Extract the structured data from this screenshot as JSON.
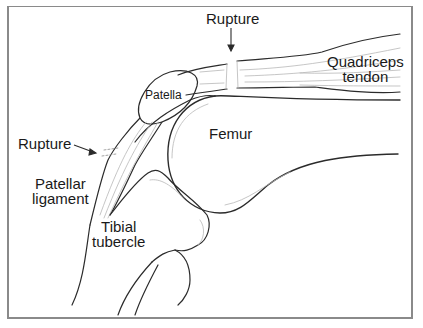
{
  "diagram": {
    "colors": {
      "line": "#2b2b2b",
      "shade": "#b8b8b8",
      "frame": "#8a8a8a",
      "background": "#ffffff"
    },
    "labels": {
      "rupture_top": "Rupture",
      "rupture_left": "Rupture",
      "quadriceps_line1": "Quadriceps",
      "quadriceps_line2": "tendon",
      "patella": "Patella",
      "femur": "Femur",
      "patellar_line1": "Patellar",
      "patellar_line2": "ligament",
      "tibial_line1": "Tibial",
      "tibial_line2": "tubercle"
    }
  }
}
